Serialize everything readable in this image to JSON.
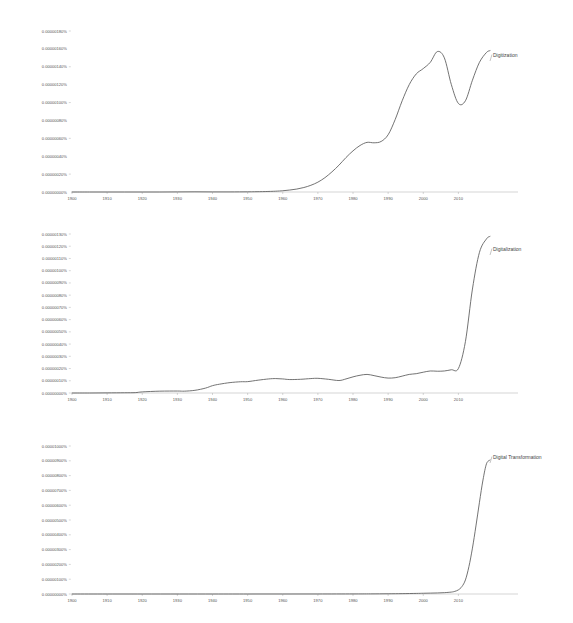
{
  "page": {
    "background_color": "#ffffff",
    "line_color": "#5a5a5a",
    "axis_color": "#aaaaaa",
    "text_color": "#555555"
  },
  "charts": [
    {
      "id": "chart-1",
      "series_label": "Digitization",
      "ylabels": [
        "0.00000000%",
        "0.00000020%",
        "0.00000040%",
        "0.00000060%",
        "0.00000080%",
        "0.00000100%",
        "0.00000120%",
        "0.00000140%",
        "0.00000160%",
        "0.00000180%"
      ],
      "xlabels": [
        "1900",
        "1910",
        "1920",
        "1930",
        "1940",
        "1950",
        "1960",
        "1970",
        "1980",
        "1990",
        "2000",
        "2010"
      ]
    },
    {
      "id": "chart-2",
      "series_label": "Digitalization",
      "ylabels": [
        "0.00000000%",
        "0.00000010%",
        "0.00000020%",
        "0.00000030%",
        "0.00000040%",
        "0.00000050%",
        "0.00000060%",
        "0.00000070%",
        "0.00000080%",
        "0.00000090%",
        "0.00000100%",
        "0.00000110%",
        "0.00000120%",
        "0.00000130%"
      ],
      "xlabels": [
        "1900",
        "1910",
        "1920",
        "1930",
        "1940",
        "1950",
        "1960",
        "1970",
        "1980",
        "1990",
        "2000",
        "2010"
      ]
    },
    {
      "id": "chart-3",
      "series_label": "Digital Transformation",
      "ylabels": [
        "0.00000000%",
        "0.00000100%",
        "0.00000200%",
        "0.00000300%",
        "0.00000400%",
        "0.00000500%",
        "0.00000600%",
        "0.00000700%",
        "0.00000800%",
        "0.00000900%",
        "0.00001000%"
      ],
      "xlabels": [
        "1900",
        "1910",
        "1920",
        "1930",
        "1940",
        "1950",
        "1960",
        "1970",
        "1980",
        "1990",
        "2000",
        "2010"
      ]
    }
  ],
  "chart_data": [
    {
      "type": "line",
      "title": "",
      "xlabel": "",
      "ylabel": "",
      "grid": false,
      "legend": "right-inline",
      "xlim": [
        1900,
        2019
      ],
      "ylim": [
        0.0,
        1.8e-06
      ],
      "ytick_values": [
        0.0,
        2e-07,
        4e-07,
        6e-07,
        8e-07,
        1e-06,
        1.2e-06,
        1.4e-06,
        1.6e-06,
        1.8e-06
      ],
      "ytick_labels": [
        "0.00000000%",
        "0.00000020%",
        "0.00000040%",
        "0.00000060%",
        "0.00000080%",
        "0.00000100%",
        "0.00000120%",
        "0.00000140%",
        "0.00000160%",
        "0.00000180%"
      ],
      "xtick_values": [
        1900,
        1910,
        1920,
        1930,
        1940,
        1950,
        1960,
        1970,
        1980,
        1990,
        2000,
        2010
      ],
      "xtick_labels": [
        "1900",
        "1910",
        "1920",
        "1930",
        "1940",
        "1950",
        "1960",
        "1970",
        "1980",
        "1990",
        "2000",
        "2010"
      ],
      "series": [
        {
          "name": "Digitization",
          "x": [
            1900,
            1905,
            1910,
            1915,
            1920,
            1925,
            1930,
            1935,
            1940,
            1945,
            1950,
            1952,
            1955,
            1958,
            1960,
            1962,
            1964,
            1966,
            1968,
            1970,
            1972,
            1974,
            1976,
            1978,
            1980,
            1982,
            1984,
            1986,
            1988,
            1990,
            1992,
            1994,
            1996,
            1998,
            2000,
            2002,
            2004,
            2006,
            2008,
            2010,
            2012,
            2014,
            2016,
            2018,
            2019
          ],
          "y": [
            0.0,
            0.0,
            0.0,
            0.0,
            0.0,
            0.0,
            1e-09,
            2e-09,
            1e-09,
            1e-09,
            2e-09,
            3e-09,
            5e-09,
            9e-09,
            1.4e-08,
            2.2e-08,
            3.3e-08,
            5e-08,
            7.5e-08,
            1.1e-07,
            1.6e-07,
            2.25e-07,
            3e-07,
            3.85e-07,
            4.6e-07,
            5.2e-07,
            5.55e-07,
            5.5e-07,
            5.65e-07,
            6.4e-07,
            8.1e-07,
            1.02e-06,
            1.2e-06,
            1.32e-06,
            1.38e-06,
            1.45e-06,
            1.57e-06,
            1.5e-06,
            1.2e-06,
            9.9e-07,
            1.02e-06,
            1.25e-06,
            1.45e-06,
            1.56e-06,
            1.58e-06
          ]
        }
      ]
    },
    {
      "type": "line",
      "title": "",
      "xlabel": "",
      "ylabel": "",
      "grid": false,
      "legend": "right-inline",
      "xlim": [
        1900,
        2019
      ],
      "ylim": [
        0.0,
        1.3e-06
      ],
      "ytick_values": [
        0.0,
        1e-07,
        2e-07,
        3e-07,
        4e-07,
        5e-07,
        6e-07,
        7e-07,
        8e-07,
        9e-07,
        1e-06,
        1.1e-06,
        1.2e-06,
        1.3e-06
      ],
      "ytick_labels": [
        "0.00000000%",
        "0.00000010%",
        "0.00000020%",
        "0.00000030%",
        "0.00000040%",
        "0.00000050%",
        "0.00000060%",
        "0.00000070%",
        "0.00000080%",
        "0.00000090%",
        "0.00000100%",
        "0.00000110%",
        "0.00000120%",
        "0.00000130%"
      ],
      "xtick_values": [
        1900,
        1910,
        1920,
        1930,
        1940,
        1950,
        1960,
        1970,
        1980,
        1990,
        2000,
        2010
      ],
      "xtick_labels": [
        "1900",
        "1910",
        "1920",
        "1930",
        "1940",
        "1950",
        "1960",
        "1970",
        "1980",
        "1990",
        "2000",
        "2010"
      ],
      "series": [
        {
          "name": "Digitalization",
          "x": [
            1900,
            1905,
            1910,
            1915,
            1918,
            1920,
            1925,
            1930,
            1932,
            1935,
            1938,
            1940,
            1942,
            1945,
            1948,
            1950,
            1953,
            1956,
            1958,
            1960,
            1962,
            1965,
            1968,
            1970,
            1973,
            1976,
            1978,
            1980,
            1982,
            1984,
            1986,
            1988,
            1990,
            1992,
            1994,
            1996,
            1998,
            2000,
            2002,
            2004,
            2006,
            2008,
            2010,
            2012,
            2014,
            2016,
            2018,
            2019
          ],
          "y": [
            0.0,
            0.0,
            1e-09,
            2e-09,
            3e-09,
            9e-09,
            1.5e-08,
            1.6e-08,
            1.5e-08,
            2.2e-08,
            4e-08,
            6e-08,
            7.2e-08,
            8.5e-08,
            9.2e-08,
            9.3e-08,
            1.05e-07,
            1.15e-07,
            1.18e-07,
            1.15e-07,
            1.1e-07,
            1.12e-07,
            1.18e-07,
            1.2e-07,
            1.12e-07,
            1.02e-07,
            1.15e-07,
            1.32e-07,
            1.45e-07,
            1.52e-07,
            1.42e-07,
            1.3e-07,
            1.22e-07,
            1.25e-07,
            1.38e-07,
            1.52e-07,
            1.58e-07,
            1.7e-07,
            1.8e-07,
            1.78e-07,
            1.8e-07,
            1.9e-07,
            2e-07,
            4.2e-07,
            8.5e-07,
            1.15e-06,
            1.26e-06,
            1.28e-06
          ]
        }
      ]
    },
    {
      "type": "line",
      "title": "",
      "xlabel": "",
      "ylabel": "",
      "grid": false,
      "legend": "right-inline",
      "xlim": [
        1900,
        2019
      ],
      "ylim": [
        0.0,
        1e-05
      ],
      "ytick_values": [
        0.0,
        1e-06,
        2e-06,
        3e-06,
        4e-06,
        5e-06,
        6e-06,
        7e-06,
        8e-06,
        9e-06,
        1e-05
      ],
      "ytick_labels": [
        "0.00000000%",
        "0.00000100%",
        "0.00000200%",
        "0.00000300%",
        "0.00000400%",
        "0.00000500%",
        "0.00000600%",
        "0.00000700%",
        "0.00000800%",
        "0.00000900%",
        "0.00001000%"
      ],
      "xtick_values": [
        1900,
        1910,
        1920,
        1930,
        1940,
        1950,
        1960,
        1970,
        1980,
        1990,
        2000,
        2010
      ],
      "xtick_labels": [
        "1900",
        "1910",
        "1920",
        "1930",
        "1940",
        "1950",
        "1960",
        "1970",
        "1980",
        "1990",
        "2000",
        "2010"
      ],
      "series": [
        {
          "name": "Digital Transformation",
          "x": [
            1900,
            1920,
            1940,
            1950,
            1960,
            1970,
            1980,
            1985,
            1990,
            1994,
            1998,
            2000,
            2002,
            2004,
            2006,
            2008,
            2009,
            2010,
            2011,
            2012,
            2013,
            2014,
            2015,
            2016,
            2017,
            2018,
            2019
          ],
          "y": [
            0.0,
            0.0,
            0.0,
            0.0,
            1e-09,
            2e-09,
            5e-09,
            8e-09,
            1.5e-08,
            2.5e-08,
            4e-08,
            5e-08,
            6e-08,
            7e-08,
            9e-08,
            1.3e-07,
            1.8e-07,
            2.8e-07,
            5e-07,
            9.5e-07,
            1.85e-06,
            3.1e-06,
            4.6e-06,
            6.2e-06,
            7.7e-06,
            8.8e-06,
            9.05e-06
          ]
        }
      ]
    }
  ]
}
